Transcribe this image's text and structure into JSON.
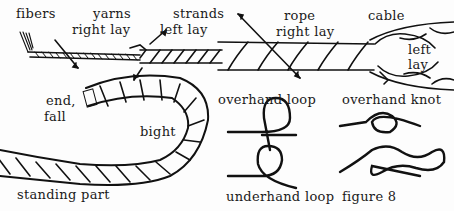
{
  "labels": {
    "fibers": "fibers",
    "yarns": "yarns",
    "yarns_lay": "right lay",
    "strands": "strands",
    "strands_lay": "left lay",
    "rope": "rope",
    "rope_lay": "right lay",
    "cable": "cable",
    "cable_lay_1": "left",
    "cable_lay_2": "lay",
    "end_1": "end,",
    "end_2": "fall",
    "bight": "bight",
    "standing_part": "standing part",
    "overhand_loop": "overhand loop",
    "underhand_loop": "underhand loop",
    "overhand_knot": "overhand knot",
    "figure_8": "figure 8"
  }
}
